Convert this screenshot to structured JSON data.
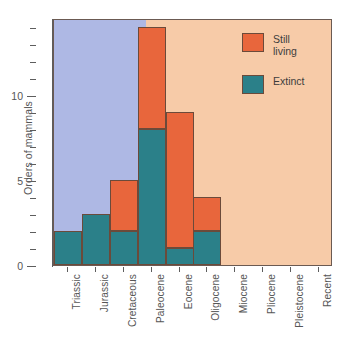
{
  "chart_data": {
    "type": "bar",
    "stacked": true,
    "title": "",
    "xlabel": "",
    "ylabel": "Orders of mammals",
    "categories": [
      "Triassic",
      "Jurassic",
      "Cretaceous",
      "Paleocene",
      "Eocene",
      "Oligocene",
      "Miocene",
      "Pliocene",
      "Pleistocene",
      "Recent"
    ],
    "series": [
      {
        "name": "Extinct",
        "color": "#2b8089",
        "values": [
          2,
          3,
          2,
          8,
          1,
          2,
          0,
          0,
          0,
          0
        ]
      },
      {
        "name": "Still living",
        "color": "#e8663c",
        "values": [
          0,
          0,
          3,
          6,
          8,
          2,
          0,
          0,
          0,
          0
        ]
      }
    ],
    "totals": [
      2,
      3,
      5,
      14,
      9,
      4,
      0,
      0,
      0,
      0
    ],
    "ylim": [
      0,
      14.5
    ],
    "ytick_labels": [
      "0",
      "5",
      "10"
    ],
    "ytick_values": [
      0,
      5,
      10
    ],
    "yminor_values": [
      1,
      2,
      3,
      4,
      6,
      7,
      8,
      9,
      11,
      12,
      13,
      14
    ],
    "grid": false,
    "legend_position": "top-right",
    "background_bands": [
      {
        "name": "Mesozoic",
        "color": "#aeb8e4",
        "from_category": "Triassic",
        "to_category": "Cretaceous"
      },
      {
        "name": "Cenozoic",
        "color": "#f7cba8",
        "from_category": "Paleocene",
        "to_category": "Recent"
      }
    ]
  },
  "legend": {
    "entries": [
      {
        "label": "Still\nliving",
        "color": "#e8663c"
      },
      {
        "label": "Extinct",
        "color": "#2b8089"
      }
    ]
  },
  "axes": {
    "y_title": "Orders of mammals"
  }
}
